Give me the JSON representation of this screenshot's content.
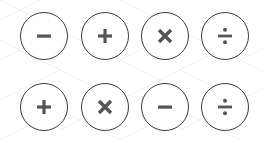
{
  "colors": {
    "stroke": "#3a3a3a",
    "glyph": "#555555",
    "background": "#ffffff",
    "pattern": "#eeeeee"
  },
  "rows": [
    {
      "buttons": [
        {
          "op": "minus",
          "symbol": "−",
          "label": "subtract"
        },
        {
          "op": "plus",
          "symbol": "+",
          "label": "add"
        },
        {
          "op": "times",
          "symbol": "×",
          "label": "multiply"
        },
        {
          "op": "divide",
          "symbol": "÷",
          "label": "divide"
        }
      ]
    },
    {
      "buttons": [
        {
          "op": "plus",
          "symbol": "+",
          "label": "add"
        },
        {
          "op": "times",
          "symbol": "×",
          "label": "multiply"
        },
        {
          "op": "minus",
          "symbol": "−",
          "label": "subtract"
        },
        {
          "op": "divide",
          "symbol": "÷",
          "label": "divide"
        }
      ]
    }
  ]
}
